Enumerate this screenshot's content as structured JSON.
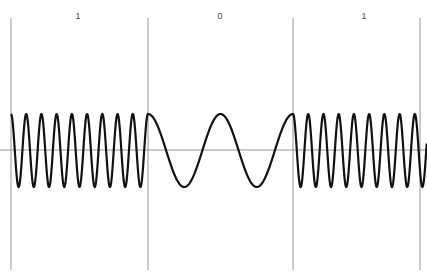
{
  "figure": {
    "width": 427,
    "height": 276,
    "background": "#ffffff",
    "kind": "fsk-modulation-waveform"
  },
  "style": {
    "grid_color": "#8a8a8a",
    "axis_color": "#8a8a8a",
    "wave_color": "#111111",
    "wave_stroke": 2.2,
    "grid_stroke": 0.9,
    "label_color": "#4a4a4a"
  },
  "axes": {
    "baseline_y": 150,
    "grid_top_y": 18,
    "grid_bottom_y": 270,
    "boundaries_x": [
      11,
      148,
      293,
      420
    ],
    "amplitude_top_y": 114,
    "amplitude_bottom_y": 187
  },
  "labels": [
    {
      "text": "1",
      "x": 78,
      "y": 12
    },
    {
      "text": "0",
      "x": 220,
      "y": 12
    },
    {
      "text": "1",
      "x": 364,
      "y": 12
    }
  ],
  "chart_data": {
    "type": "line",
    "title": "",
    "xlabel": "",
    "ylabel": "",
    "grid": true,
    "legend": null,
    "xlim": [
      11,
      427
    ],
    "ylim": [
      -1,
      1
    ],
    "annotations": [
      "1",
      "0",
      "1"
    ],
    "bit_sequence": [
      "1",
      "0",
      "1"
    ],
    "segments": [
      {
        "bit": "1",
        "label": "1",
        "x_start": 11,
        "x_end": 148,
        "cycles": 9,
        "frequency": "high",
        "amplitude": 1
      },
      {
        "bit": "0",
        "label": "0",
        "x_start": 148,
        "x_end": 293,
        "cycles": 2,
        "frequency": "low",
        "amplitude": 1
      },
      {
        "bit": "1",
        "label": "1",
        "x_start": 293,
        "x_end": 427,
        "cycles": 8.8,
        "frequency": "high",
        "amplitude": 1
      }
    ]
  }
}
